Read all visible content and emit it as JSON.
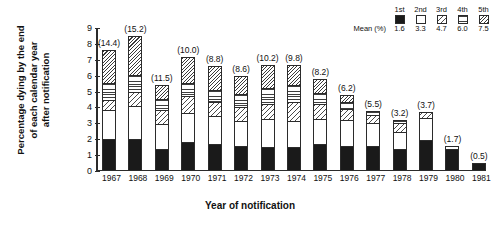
{
  "axes": {
    "ylabel_lines": [
      "Percentage dying by the end",
      "of each calendar year",
      "after notification"
    ],
    "xlabel": "Year of notification",
    "yticks": [
      "0",
      "1",
      "2",
      "3",
      "4",
      "5",
      "6",
      "7",
      "8",
      "9"
    ]
  },
  "legend": {
    "headers": [
      "1st",
      "2nd",
      "3rd",
      "4th",
      "5th"
    ],
    "mean_title": "Mean (%)",
    "means": [
      "1.6",
      "3.3",
      "4.7",
      "6.0",
      "7.5"
    ],
    "patterns": [
      "solid-black",
      "white",
      "diagonal-sparse",
      "horizontal-lines",
      "diagonal-dense"
    ]
  },
  "chart_data": {
    "type": "bar",
    "title": "",
    "xlabel": "Year of notification",
    "ylabel": "Percentage dying by the end of each calendar year after notification",
    "ylim": [
      0,
      9
    ],
    "grid": false,
    "stacked": true,
    "legend_position": "top-right",
    "categories": [
      "1967",
      "1968",
      "1969",
      "1970",
      "1971",
      "1972",
      "1973",
      "1974",
      "1975",
      "1976",
      "1977",
      "1978",
      "1979",
      "1980",
      "1981"
    ],
    "series": [
      {
        "name": "1st",
        "mean_pct": 1.6,
        "pattern": "solid-black",
        "values": [
          1.9,
          1.9,
          1.3,
          1.7,
          1.6,
          1.5,
          1.4,
          1.4,
          1.6,
          1.5,
          1.5,
          1.3,
          1.9,
          1.4,
          0.5
        ]
      },
      {
        "name": "2nd",
        "mean_pct": 3.3,
        "pattern": "white",
        "values": [
          1.9,
          2.1,
          1.6,
          1.9,
          1.8,
          1.6,
          1.8,
          1.7,
          1.6,
          1.7,
          1.5,
          1.1,
          1.4,
          0.2,
          0.0
        ]
      },
      {
        "name": "3rd",
        "mean_pct": 4.7,
        "pattern": "diagonal-sparse",
        "values": [
          0.6,
          0.9,
          0.9,
          1.1,
          0.9,
          0.9,
          1.0,
          1.2,
          1.0,
          0.7,
          0.5,
          0.6,
          0.4,
          0.0,
          0.0
        ]
      },
      {
        "name": "4th",
        "mean_pct": 6.0,
        "pattern": "horizontal-lines",
        "values": [
          1.1,
          1.1,
          0.7,
          0.8,
          0.8,
          0.8,
          1.0,
          1.1,
          0.7,
          0.4,
          0.3,
          0.2,
          0.0,
          0.0,
          0.0
        ]
      },
      {
        "name": "5th",
        "mean_pct": 7.5,
        "pattern": "diagonal-dense",
        "values": [
          2.1,
          2.5,
          0.9,
          1.7,
          1.5,
          1.2,
          1.5,
          1.3,
          0.9,
          0.5,
          0.0,
          0.0,
          0.0,
          0.0,
          0.0
        ]
      }
    ],
    "totals_labels": [
      "(14.4)",
      "(15.2)",
      "(11.5)",
      "(10.0)",
      "(8.8)",
      "(8.6)",
      "(10.2)",
      "(9.8)",
      "(8.2)",
      "(6.2)",
      "(5.5)",
      "(3.2)",
      "(3.7)",
      "(1.7)",
      "(0.5)"
    ],
    "totals": [
      14.4,
      15.2,
      11.5,
      10.0,
      8.8,
      8.6,
      10.2,
      9.8,
      8.2,
      6.2,
      5.5,
      3.2,
      3.7,
      1.7,
      0.5
    ],
    "bar_tops": [
      7.6,
      8.5,
      5.4,
      7.2,
      6.6,
      6.0,
      6.7,
      6.7,
      5.8,
      4.8,
      3.8,
      3.2,
      3.7,
      1.6,
      0.5
    ]
  }
}
